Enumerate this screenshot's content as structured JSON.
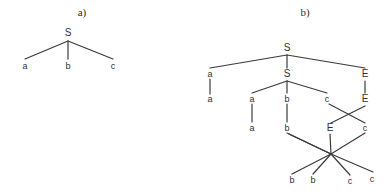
{
  "figure": {
    "width": 391,
    "height": 194,
    "background": "#ffffff",
    "stroke_color": "#3a3a3a",
    "text_color": "#2f2f2f"
  },
  "panels": [
    {
      "id": "a",
      "label": "a)",
      "label_x": 82,
      "label_y": 12
    },
    {
      "id": "b",
      "label": "b)",
      "label_x": 305,
      "label_y": 12
    }
  ],
  "tree_a": {
    "nodes": [
      {
        "id": "a-root",
        "text": "S",
        "x": 68,
        "y": 33,
        "size": "big"
      },
      {
        "id": "a-leaf-1",
        "text": "a",
        "x": 25,
        "y": 66,
        "size": "small"
      },
      {
        "id": "a-leaf-2",
        "text": "b",
        "x": 68,
        "y": 66,
        "size": "small"
      },
      {
        "id": "a-leaf-3",
        "text": "c",
        "x": 113,
        "y": 66,
        "size": "small"
      }
    ],
    "edges": [
      {
        "x1": 68,
        "y1": 41,
        "x2": 25,
        "y2": 59
      },
      {
        "x1": 68,
        "y1": 41,
        "x2": 68,
        "y2": 59
      },
      {
        "x1": 68,
        "y1": 41,
        "x2": 113,
        "y2": 59
      }
    ]
  },
  "tree_b": {
    "nodes": [
      {
        "id": "b-root-S",
        "text": "S",
        "x": 287,
        "y": 48,
        "size": "big"
      },
      {
        "id": "b-l1-a",
        "text": "a",
        "x": 210,
        "y": 74,
        "size": "small"
      },
      {
        "id": "b-l1-S",
        "text": "S",
        "x": 287,
        "y": 74,
        "size": "big"
      },
      {
        "id": "b-l1-E",
        "text": "E",
        "x": 365,
        "y": 74,
        "size": "big"
      },
      {
        "id": "b-l2-a-outer",
        "text": "a",
        "x": 210,
        "y": 99,
        "size": "small"
      },
      {
        "id": "b-l2-a-inner",
        "text": "a",
        "x": 252,
        "y": 99,
        "size": "small"
      },
      {
        "id": "b-l2-b",
        "text": "b",
        "x": 287,
        "y": 99,
        "size": "small"
      },
      {
        "id": "b-l2-c",
        "text": "c",
        "x": 327,
        "y": 99,
        "size": "small"
      },
      {
        "id": "b-l2-E",
        "text": "E",
        "x": 365,
        "y": 99,
        "size": "big"
      },
      {
        "id": "b-l3-a",
        "text": "a",
        "x": 252,
        "y": 128,
        "size": "small"
      },
      {
        "id": "b-l3-b",
        "text": "b",
        "x": 287,
        "y": 128,
        "size": "small"
      },
      {
        "id": "b-l3-E",
        "text": "E",
        "x": 330,
        "y": 128,
        "size": "big"
      },
      {
        "id": "b-l3-c",
        "text": "c",
        "x": 365,
        "y": 128,
        "size": "small"
      },
      {
        "id": "b-leaf-b1",
        "text": "b",
        "x": 292,
        "y": 180,
        "size": "small"
      },
      {
        "id": "b-leaf-b2",
        "text": "b",
        "x": 313,
        "y": 180,
        "size": "small"
      },
      {
        "id": "b-leaf-c1",
        "text": "c",
        "x": 350,
        "y": 181,
        "size": "small"
      },
      {
        "id": "b-leaf-c2",
        "text": "c",
        "x": 372,
        "y": 179,
        "size": "small"
      }
    ],
    "edges": [
      {
        "x1": 287,
        "y1": 55,
        "x2": 210,
        "y2": 68
      },
      {
        "x1": 287,
        "y1": 55,
        "x2": 287,
        "y2": 68
      },
      {
        "x1": 287,
        "y1": 55,
        "x2": 365,
        "y2": 68
      },
      {
        "x1": 210,
        "y1": 79,
        "x2": 210,
        "y2": 94
      },
      {
        "x1": 287,
        "y1": 81,
        "x2": 252,
        "y2": 93
      },
      {
        "x1": 287,
        "y1": 81,
        "x2": 287,
        "y2": 93
      },
      {
        "x1": 287,
        "y1": 81,
        "x2": 327,
        "y2": 93
      },
      {
        "x1": 365,
        "y1": 81,
        "x2": 365,
        "y2": 93
      },
      {
        "x1": 252,
        "y1": 104,
        "x2": 252,
        "y2": 122
      },
      {
        "x1": 287,
        "y1": 104,
        "x2": 287,
        "y2": 122
      },
      {
        "x1": 329,
        "y1": 104,
        "x2": 365,
        "y2": 123
      },
      {
        "x1": 365,
        "y1": 106,
        "x2": 331,
        "y2": 123
      },
      {
        "x1": 287,
        "y1": 133,
        "x2": 331,
        "y2": 154
      },
      {
        "x1": 330,
        "y1": 134,
        "x2": 331,
        "y2": 154
      },
      {
        "x1": 331,
        "y1": 154,
        "x2": 365,
        "y2": 133
      },
      {
        "x1": 331,
        "y1": 154,
        "x2": 289,
        "y2": 134
      },
      {
        "x1": 331,
        "y1": 154,
        "x2": 292,
        "y2": 174
      },
      {
        "x1": 331,
        "y1": 154,
        "x2": 313,
        "y2": 174
      },
      {
        "x1": 331,
        "y1": 154,
        "x2": 350,
        "y2": 175
      },
      {
        "x1": 331,
        "y1": 154,
        "x2": 373,
        "y2": 172
      }
    ]
  }
}
